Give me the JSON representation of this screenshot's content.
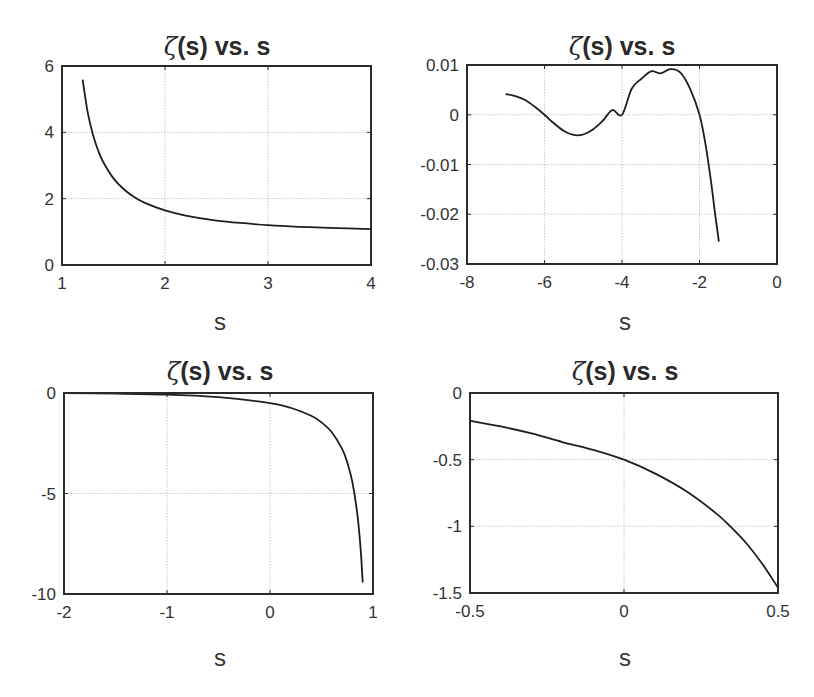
{
  "figure": {
    "subplots": [
      {
        "title_symbol": "ζ",
        "title_rest": "(s) vs. s",
        "xlabel": "s",
        "xticks": [
          "1",
          "2",
          "3",
          "4"
        ],
        "yticks": [
          "0",
          "2",
          "4",
          "6"
        ]
      },
      {
        "title_symbol": "ζ",
        "title_rest": "(s) vs. s",
        "xlabel": "s",
        "xticks": [
          "-8",
          "-6",
          "-4",
          "-2",
          "0"
        ],
        "yticks": [
          "-0.03",
          "-0.02",
          "-0.01",
          "0",
          "0.01"
        ]
      },
      {
        "title_symbol": "ζ",
        "title_rest": "(s) vs. s",
        "xlabel": "s",
        "xticks": [
          "-2",
          "-1",
          "0",
          "1"
        ],
        "yticks": [
          "-10",
          "-5",
          "0"
        ]
      },
      {
        "title_symbol": "ζ",
        "title_rest": "(s) vs. s",
        "xlabel": "s",
        "xticks": [
          "-0.5",
          "0",
          "0.5"
        ],
        "yticks": [
          "-1.5",
          "-1",
          "-0.5",
          "0"
        ]
      }
    ]
  },
  "chart_data": [
    {
      "type": "line",
      "title": "ζ(s) vs. s",
      "xlabel": "s",
      "ylabel": "",
      "xlim": [
        1,
        4
      ],
      "ylim": [
        0,
        6
      ],
      "xticks": [
        1,
        2,
        3,
        4
      ],
      "yticks": [
        0,
        2,
        4,
        6
      ],
      "grid": true,
      "legend": null,
      "series": [
        {
          "name": "zeta(s)",
          "x": [
            1.2,
            1.25,
            1.3,
            1.35,
            1.4,
            1.5,
            1.6,
            1.7,
            1.8,
            2.0,
            2.2,
            2.5,
            2.8,
            3.0,
            3.3,
            3.6,
            4.0
          ],
          "y": [
            5.592,
            4.595,
            3.932,
            3.459,
            3.106,
            2.612,
            2.285,
            2.054,
            1.882,
            1.645,
            1.491,
            1.341,
            1.253,
            1.202,
            1.152,
            1.117,
            1.082
          ]
        }
      ]
    },
    {
      "type": "line",
      "title": "ζ(s) vs. s",
      "xlabel": "s",
      "ylabel": "",
      "xlim": [
        -8,
        0
      ],
      "ylim": [
        -0.03,
        0.01
      ],
      "xticks": [
        -8,
        -6,
        -4,
        -2,
        0
      ],
      "yticks": [
        -0.03,
        -0.02,
        -0.01,
        0,
        0.01
      ],
      "grid": true,
      "legend": null,
      "series": [
        {
          "name": "zeta(s)",
          "x": [
            -7.0,
            -6.75,
            -6.5,
            -6.25,
            -6.0,
            -5.75,
            -5.5,
            -5.25,
            -5.0,
            -4.75,
            -4.5,
            -4.25,
            -4.0,
            -3.75,
            -3.5,
            -3.25,
            -3.0,
            -2.75,
            -2.5,
            -2.25,
            -2.0,
            -1.85,
            -1.7,
            -1.6,
            -1.5
          ],
          "y": [
            0.00417,
            0.00374,
            0.00298,
            0.00161,
            0.0,
            -0.00177,
            -0.00325,
            -0.00406,
            -0.00397,
            -0.00297,
            -0.00125,
            0.00094,
            0.0,
            0.00523,
            0.00723,
            0.00874,
            0.00833,
            0.00916,
            0.00851,
            0.00535,
            0.0,
            -0.00571,
            -0.01357,
            -0.01975,
            -0.02549
          ]
        }
      ]
    },
    {
      "type": "line",
      "title": "ζ(s) vs. s",
      "xlabel": "s",
      "ylabel": "",
      "xlim": [
        -2,
        1
      ],
      "ylim": [
        -10,
        0
      ],
      "xticks": [
        -2,
        -1,
        0,
        1
      ],
      "yticks": [
        -10,
        -5,
        0
      ],
      "grid": true,
      "legend": null,
      "series": [
        {
          "name": "zeta(s)",
          "x": [
            -2.0,
            -1.5,
            -1.0,
            -0.5,
            0.0,
            0.2,
            0.4,
            0.5,
            0.6,
            0.7,
            0.75,
            0.8,
            0.85,
            0.88,
            0.9
          ],
          "y": [
            0.0,
            -0.0255,
            -0.0833,
            -0.2079,
            -0.5,
            -0.7339,
            -1.1347,
            -1.4604,
            -1.9551,
            -2.7783,
            -3.4434,
            -4.4375,
            -6.1108,
            -7.7705,
            -9.4305
          ]
        }
      ]
    },
    {
      "type": "line",
      "title": "ζ(s) vs. s",
      "xlabel": "s",
      "ylabel": "",
      "xlim": [
        -0.5,
        0.5
      ],
      "ylim": [
        -1.5,
        0
      ],
      "xticks": [
        -0.5,
        0,
        0.5
      ],
      "yticks": [
        -1.5,
        -1,
        -0.5,
        0
      ],
      "grid": true,
      "legend": null,
      "series": [
        {
          "name": "zeta(s)",
          "x": [
            -0.5,
            -0.4,
            -0.3,
            -0.2,
            -0.1,
            0.0,
            0.1,
            0.2,
            0.3,
            0.35,
            0.4,
            0.45,
            0.5
          ],
          "y": [
            -0.2079,
            -0.2512,
            -0.3036,
            -0.3676,
            -0.4263,
            -0.5,
            -0.603,
            -0.7339,
            -0.9045,
            -1.0119,
            -1.1347,
            -1.2851,
            -1.4604
          ]
        }
      ]
    }
  ]
}
